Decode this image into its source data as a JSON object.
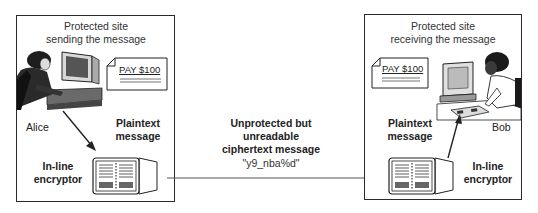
{
  "sender_site": {
    "title_line1": "Protected site",
    "title_line2": "sending the message",
    "person_name": "Alice",
    "document_text": "PAY $100",
    "plaintext_label_line1": "Plaintext",
    "plaintext_label_line2": "message",
    "encryptor_label_line1": "In-line",
    "encryptor_label_line2": "encryptor"
  },
  "receiver_site": {
    "title_line1": "Protected site",
    "title_line2": "receiving the message",
    "person_name": "Bob",
    "document_text": "PAY $100",
    "plaintext_label_line1": "Plaintext",
    "plaintext_label_line2": "message",
    "encryptor_label_line1": "In-line",
    "encryptor_label_line2": "encryptor"
  },
  "channel": {
    "label_line1": "Unprotected but",
    "label_line2": "unreadable",
    "label_line3": "ciphertext message",
    "ciphertext": "\"y9_nba%d\""
  },
  "icons": [
    "person-at-computer-icon",
    "document-icon",
    "encryptor-device-icon",
    "arrow-icon"
  ],
  "colors": {
    "line": "#2a2a2a",
    "fill_dark": "#3a3a3a",
    "fill_mid": "#8a8a8a",
    "background": "#ffffff"
  }
}
